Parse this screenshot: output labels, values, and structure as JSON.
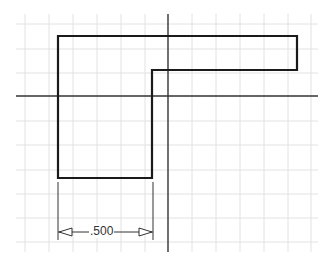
{
  "diagram": {
    "type": "technical-drawing",
    "grid": {
      "x_lines": [
        25,
        49,
        73,
        97,
        121,
        145,
        169,
        193,
        217,
        241,
        265,
        289,
        313
      ],
      "y_lines": [
        24,
        49,
        73,
        97,
        121,
        145,
        170,
        194,
        218,
        242
      ],
      "color": "#e2e2e2"
    },
    "outline_points": [
      [
        58,
        36
      ],
      [
        297,
        36
      ],
      [
        297,
        70
      ],
      [
        152,
        70
      ],
      [
        152,
        178
      ],
      [
        58,
        178
      ]
    ],
    "axes": {
      "horizontal": {
        "y": 96,
        "x1": 16,
        "x2": 318
      },
      "vertical": {
        "x": 168,
        "y1": 14,
        "y2": 252
      }
    },
    "dimension": {
      "label": ".500",
      "x1": 58,
      "x2": 153,
      "y": 232
    }
  }
}
